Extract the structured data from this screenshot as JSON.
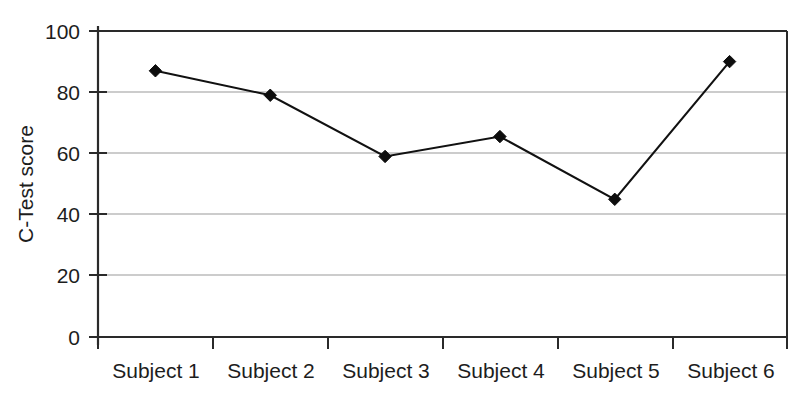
{
  "chart_data": {
    "type": "line",
    "title": "",
    "subtitle": "",
    "xlabel": "",
    "ylabel": "C-Test score",
    "categories": [
      "Subject 1",
      "Subject 2",
      "Subject 3",
      "Subject 4",
      "Subject 5",
      "Subject 6"
    ],
    "values": [
      87,
      79,
      59,
      65.5,
      45,
      90
    ],
    "series": [
      {
        "name": "C-Test score",
        "values": [
          87,
          79,
          59,
          65.5,
          45,
          90
        ]
      }
    ],
    "ylim": [
      0,
      100
    ],
    "yticks": [
      0,
      20,
      40,
      60,
      80,
      100
    ],
    "ytick_labels": [
      "0",
      "20",
      "40",
      "60",
      "80",
      "100"
    ],
    "grid": true,
    "grid_axis": "y",
    "legend": false,
    "legend_position": "none",
    "marker": "diamond",
    "line_color": "#111111",
    "marker_color": "#0d0d0d",
    "grid_color": "#9a9a9a",
    "background_color": "#ffffff",
    "annotations": []
  },
  "axes": {
    "y_title": "C-Test score",
    "y_tick_0": "0",
    "y_tick_1": "20",
    "y_tick_2": "40",
    "y_tick_3": "60",
    "y_tick_4": "80",
    "y_tick_5": "100",
    "x_tick_0": "Subject 1",
    "x_tick_1": "Subject 2",
    "x_tick_2": "Subject 3",
    "x_tick_3": "Subject 4",
    "x_tick_4": "Subject 5",
    "x_tick_5": "Subject 6"
  }
}
